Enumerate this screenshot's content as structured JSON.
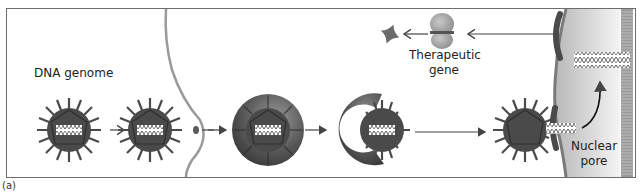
{
  "figure": {
    "panel_label": "(a)",
    "labels": {
      "dna_genome": "DNA genome",
      "therapeutic_gene": "Therapeutic gene",
      "therapeutic_gene_line1": "Therapeutic",
      "therapeutic_gene_line2": "gene",
      "nuclear_pore": "Nuclear pore",
      "nuclear_pore_line1": "Nuclear",
      "nuclear_pore_line2": "pore"
    },
    "stages": [
      {
        "id": "free-virus",
        "description": "Virus particle with DNA genome"
      },
      {
        "id": "binding",
        "description": "Virus binds to cell membrane receptor"
      },
      {
        "id": "endosome",
        "description": "Virus enclosed in endosome"
      },
      {
        "id": "endosome-escape",
        "description": "Virus escapes endosome"
      },
      {
        "id": "docking",
        "description": "Virus docks at nuclear pore and releases DNA"
      },
      {
        "id": "nuclear-dna",
        "description": "DNA inside nucleus"
      },
      {
        "id": "protein",
        "description": "Therapeutic gene expressed as protein"
      }
    ],
    "colors": {
      "virus": "#4a4a4a",
      "virus_dark": "#2e2e2e",
      "membrane": "#9a9a9a",
      "nucleus": "#c8c8c8",
      "nuclear_envelope": "#7a7a7a",
      "arrow": "#444444",
      "protein": "#8a8a8a",
      "frame": "#6d6d6d"
    }
  }
}
